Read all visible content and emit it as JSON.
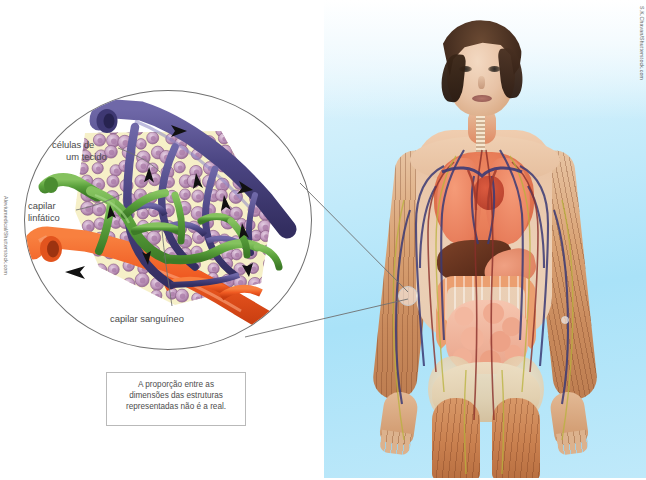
{
  "figure": {
    "type": "scientific-illustration",
    "language": "pt-BR"
  },
  "magnifier": {
    "title": "Detalhe ampliado do leito capilar",
    "labels": [
      {
        "id": "celulas",
        "text_line1": "células de",
        "text_line2": "um tecido"
      },
      {
        "id": "capilar-linfatico",
        "text_line1": "capilar",
        "text_line2": "linfático"
      },
      {
        "id": "capilar-sanguineo",
        "text_line1": "capilar sanguíneo",
        "text_line2": ""
      }
    ],
    "colors": {
      "lymph_capillary": "#5aa13c",
      "vein": "#4b4582",
      "artery": "#ef5a22",
      "tissue_cell": "#c39cc0",
      "tissue_fluid": "#f6f0c8",
      "outline": "#6f6f6f"
    }
  },
  "note": {
    "line1": "A proporção entre as",
    "line2": "dimensões das estruturas",
    "line3": "representadas não é a real."
  },
  "credits": {
    "left": "Aleviumedical/Shutterstock.com",
    "right": "S.K.Chavan/Shutterstock.com"
  },
  "photo_panel": {
    "caption": "Figura feminina com sistemas circulatório e linfático visíveis",
    "background_color": "#b7e6f8",
    "highlight_target": "capilar no antebraço direito"
  }
}
